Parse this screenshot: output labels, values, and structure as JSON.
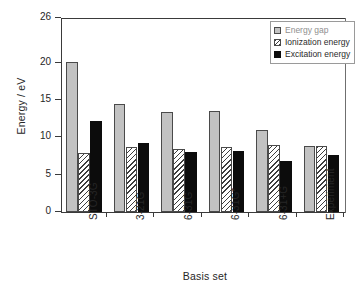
{
  "chart_data": {
    "type": "bar",
    "title": "",
    "xlabel": "Basis set",
    "ylabel": "Energy / eV",
    "categories": [
      "STO-3G",
      "3-21G",
      "6-31G",
      "6-31G*",
      "6-31+G",
      "Experiment"
    ],
    "series": [
      {
        "name": "Energy gap",
        "values": [
          20.1,
          14.5,
          13.4,
          13.5,
          11.0,
          8.8
        ],
        "color": "#c2c2c2",
        "pattern": "solid-gray"
      },
      {
        "name": "Ionization energy",
        "values": [
          7.9,
          8.7,
          8.4,
          8.7,
          9.0,
          8.8
        ],
        "color": "#f2f2f2",
        "pattern": "diagonal-hatch"
      },
      {
        "name": "Excitation energy",
        "values": [
          12.2,
          9.2,
          8.1,
          8.2,
          6.9,
          7.6
        ],
        "color": "#0c0c0c",
        "pattern": "solid-black"
      }
    ],
    "ylim": [
      0,
      26
    ],
    "yticks": [
      0,
      5,
      10,
      15,
      20,
      26
    ],
    "ytick_labels": [
      "0",
      "5",
      "10",
      "15",
      "20",
      "26"
    ],
    "grid": false,
    "legend_position": "top-right",
    "legend_entries": [
      "Energy gap",
      "Ionization energy",
      "Excitation energy"
    ]
  }
}
